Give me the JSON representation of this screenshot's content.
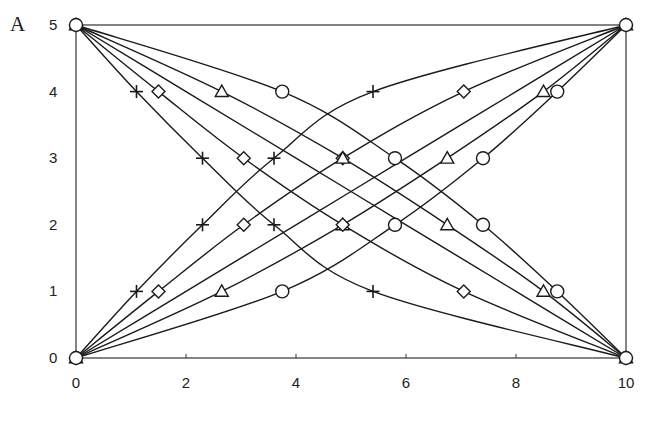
{
  "panel_label": "A",
  "chart_data": {
    "type": "line",
    "title": "",
    "xlabel": "",
    "ylabel": "",
    "xlim": [
      0,
      10
    ],
    "ylim": [
      0,
      5
    ],
    "xticks": [
      0,
      2,
      4,
      6,
      8,
      10
    ],
    "yticks": [
      0,
      1,
      2,
      3,
      4,
      5
    ],
    "grid": false,
    "legend": null,
    "frame": "box",
    "series": [
      {
        "name": "ascending-plus",
        "marker": "plus",
        "direction": "ascending",
        "points": [
          [
            0,
            0
          ],
          [
            1.1,
            1
          ],
          [
            2.3,
            2
          ],
          [
            3.6,
            3
          ],
          [
            5.4,
            4
          ],
          [
            10,
            5
          ]
        ],
        "marked": [
          1,
          2,
          3,
          4
        ]
      },
      {
        "name": "ascending-diamond",
        "marker": "diamond",
        "direction": "ascending",
        "points": [
          [
            0,
            0
          ],
          [
            1.5,
            1
          ],
          [
            3.05,
            2
          ],
          [
            4.85,
            3
          ],
          [
            7.05,
            4
          ],
          [
            10,
            5
          ]
        ],
        "marked": [
          1,
          2,
          3,
          4
        ]
      },
      {
        "name": "ascending-linear",
        "marker": "none",
        "direction": "ascending",
        "points": [
          [
            0,
            0
          ],
          [
            2,
            1
          ],
          [
            4,
            2
          ],
          [
            6,
            3
          ],
          [
            8,
            4
          ],
          [
            10,
            5
          ]
        ],
        "marked": []
      },
      {
        "name": "ascending-triangle",
        "marker": "triangle",
        "direction": "ascending",
        "points": [
          [
            0,
            0
          ],
          [
            2.65,
            1
          ],
          [
            4.85,
            2
          ],
          [
            6.75,
            3
          ],
          [
            8.5,
            4
          ],
          [
            10,
            5
          ]
        ],
        "marked": [
          1,
          2,
          3,
          4
        ]
      },
      {
        "name": "ascending-circle",
        "marker": "circle",
        "direction": "ascending",
        "points": [
          [
            0,
            0
          ],
          [
            3.75,
            1
          ],
          [
            5.8,
            2
          ],
          [
            7.4,
            3
          ],
          [
            8.75,
            4
          ],
          [
            10,
            5
          ]
        ],
        "marked": [
          1,
          2,
          3,
          4
        ]
      },
      {
        "name": "descending-plus",
        "marker": "plus",
        "direction": "descending",
        "points": [
          [
            0,
            5
          ],
          [
            1.1,
            4
          ],
          [
            2.3,
            3
          ],
          [
            3.6,
            2
          ],
          [
            5.4,
            1
          ],
          [
            10,
            0
          ]
        ],
        "marked": [
          1,
          2,
          3,
          4
        ]
      },
      {
        "name": "descending-diamond",
        "marker": "diamond",
        "direction": "descending",
        "points": [
          [
            0,
            5
          ],
          [
            1.5,
            4
          ],
          [
            3.05,
            3
          ],
          [
            4.85,
            2
          ],
          [
            7.05,
            1
          ],
          [
            10,
            0
          ]
        ],
        "marked": [
          1,
          2,
          3,
          4
        ]
      },
      {
        "name": "descending-linear",
        "marker": "none",
        "direction": "descending",
        "points": [
          [
            0,
            5
          ],
          [
            2,
            4
          ],
          [
            4,
            3
          ],
          [
            6,
            2
          ],
          [
            8,
            1
          ],
          [
            10,
            0
          ]
        ],
        "marked": []
      },
      {
        "name": "descending-triangle",
        "marker": "triangle",
        "direction": "descending",
        "points": [
          [
            0,
            5
          ],
          [
            2.65,
            4
          ],
          [
            4.85,
            3
          ],
          [
            6.75,
            2
          ],
          [
            8.5,
            1
          ],
          [
            10,
            0
          ]
        ],
        "marked": [
          1,
          2,
          3,
          4
        ]
      },
      {
        "name": "descending-circle",
        "marker": "circle",
        "direction": "descending",
        "points": [
          [
            0,
            5
          ],
          [
            3.75,
            4
          ],
          [
            5.8,
            3
          ],
          [
            7.4,
            2
          ],
          [
            8.75,
            1
          ],
          [
            10,
            0
          ]
        ],
        "marked": [
          1,
          2,
          3,
          4
        ]
      }
    ],
    "endpoint_markers": [
      {
        "x": 0,
        "y": 5,
        "markers": [
          "plus",
          "diamond",
          "triangle",
          "circle"
        ]
      },
      {
        "x": 10,
        "y": 5,
        "markers": [
          "plus",
          "diamond",
          "triangle",
          "circle"
        ]
      },
      {
        "x": 0,
        "y": 0,
        "markers": [
          "plus",
          "diamond",
          "triangle",
          "circle"
        ]
      },
      {
        "x": 10,
        "y": 0,
        "markers": [
          "plus",
          "diamond",
          "triangle",
          "circle"
        ]
      }
    ]
  },
  "colors": {
    "line": "#1a1a1a",
    "frame": "#333333",
    "background": "#ffffff"
  }
}
